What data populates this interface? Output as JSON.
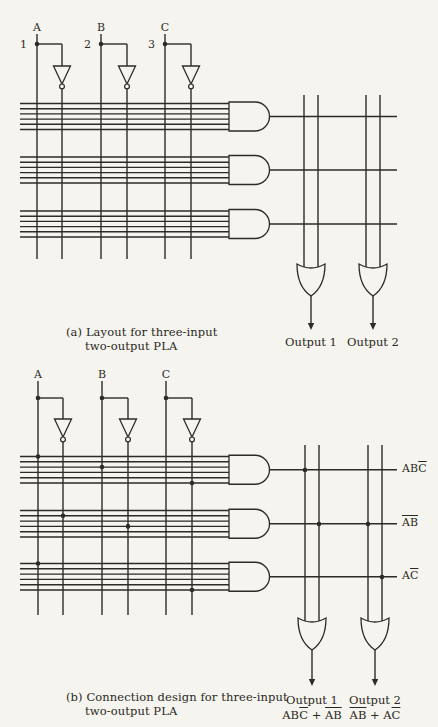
{
  "page": {
    "bg_color": "#f6f4ee",
    "ink_color": "#2e2b27",
    "width": 438,
    "height": 727
  },
  "diagrams": [
    {
      "name": "pla-layout",
      "caption": [
        "(a) Layout for three-input",
        "two-output PLA"
      ],
      "inputs": [
        {
          "label": "A",
          "pin": "1",
          "x": 37,
          "inv_x": 62
        },
        {
          "label": "B",
          "pin": "2",
          "x": 101,
          "inv_x": 127
        },
        {
          "label": "C",
          "pin": "3",
          "x": 165,
          "inv_x": 191
        }
      ],
      "geometry": {
        "label_y": 31,
        "stub_top": 34,
        "branch_y": 44,
        "inv_top": 66,
        "inv_bottom": 84,
        "col_bottom": 259,
        "row_left": 20,
        "gate_left": 229,
        "out_right": 397,
        "line_spacing": 5.2,
        "line_count": 6,
        "or_col_top": 95,
        "or_gate_top": 264,
        "or_gate_point": 296,
        "arrow_tip": 330
      },
      "and_rows": [
        {
          "y_top": 103.5
        },
        {
          "y_top": 157
        },
        {
          "y_top": 211
        }
      ],
      "or_cols": [
        304,
        318,
        366,
        380
      ],
      "or_gates": [
        {
          "cx": 311
        },
        {
          "cx": 373
        }
      ],
      "outputs": [
        {
          "label": "Output 1",
          "cx": 311
        },
        {
          "label": "Output 2",
          "cx": 373
        }
      ],
      "output_label_y": 335,
      "and_dots": [],
      "or_dots": [],
      "row_labels": []
    },
    {
      "name": "pla-connection-design",
      "caption": [
        "(b) Connection design for three-input",
        "two-output PLA"
      ],
      "inputs": [
        {
          "label": "A",
          "x": 38,
          "inv_x": 63
        },
        {
          "label": "B",
          "x": 102,
          "inv_x": 128
        },
        {
          "label": "C",
          "x": 166,
          "inv_x": 192
        }
      ],
      "geometry": {
        "label_y": 378,
        "stub_top": 381,
        "branch_y": 398,
        "inv_top": 419,
        "inv_bottom": 437,
        "col_bottom": 615,
        "row_left": 20,
        "gate_left": 229,
        "out_right": 397,
        "line_spacing": 5.3,
        "line_count": 6,
        "or_col_top": 445,
        "or_gate_top": 618,
        "or_gate_point": 650,
        "arrow_tip": 686
      },
      "and_rows": [
        {
          "y_top": 456.5
        },
        {
          "y_top": 510.5
        },
        {
          "y_top": 563.5
        }
      ],
      "or_cols": [
        305,
        319,
        368,
        382
      ],
      "or_gates": [
        {
          "cx": 312
        },
        {
          "cx": 375
        }
      ],
      "outputs": [
        {
          "label": "Output 1",
          "cx": 312,
          "formula": [
            {
              "t": "AB"
            },
            {
              "t": "C",
              "bar": true
            },
            {
              "t": " + "
            },
            {
              "t": "AB",
              "bar": true
            }
          ]
        },
        {
          "label": "Output 2",
          "cx": 375,
          "formula": [
            {
              "t": "AB",
              "bar": true
            },
            {
              "t": " + A"
            },
            {
              "t": "C",
              "bar": true
            }
          ]
        }
      ],
      "output_label_y": 693,
      "and_dots": [
        {
          "x": 38,
          "y": 456.5
        },
        {
          "x": 102,
          "y": 467.1
        },
        {
          "x": 192,
          "y": 483
        },
        {
          "x": 63,
          "y": 515.8
        },
        {
          "x": 128,
          "y": 526.4
        },
        {
          "x": 38,
          "y": 563.5
        },
        {
          "x": 192,
          "y": 590
        }
      ],
      "or_dots": [
        {
          "x": 305,
          "y": 470
        },
        {
          "x": 319,
          "y": 524
        },
        {
          "x": 368,
          "y": 524
        },
        {
          "x": 382,
          "y": 577
        }
      ],
      "row_labels": [
        {
          "x": 402,
          "y": 470,
          "segs": [
            {
              "t": "AB"
            },
            {
              "t": "C",
              "bar": true
            }
          ]
        },
        {
          "x": 402,
          "y": 524,
          "segs": [
            {
              "t": "AB",
              "bar": true
            }
          ]
        },
        {
          "x": 402,
          "y": 577,
          "segs": [
            {
              "t": "A"
            },
            {
              "t": "C",
              "bar": true
            }
          ]
        }
      ]
    }
  ]
}
